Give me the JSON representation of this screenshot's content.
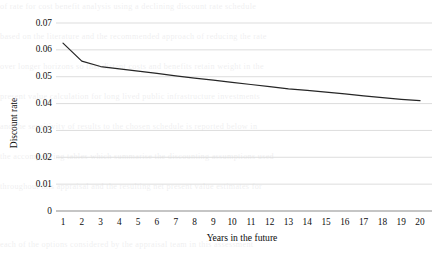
{
  "chart_data": {
    "type": "line",
    "title": "",
    "xlabel": "Years in the future",
    "ylabel": "Discount rate",
    "x": [
      1,
      2,
      3,
      4,
      5,
      6,
      7,
      8,
      9,
      10,
      11,
      12,
      13,
      14,
      15,
      16,
      17,
      18,
      19,
      20
    ],
    "values": [
      0.0625,
      0.0558,
      0.0538,
      0.0529,
      0.0521,
      0.0512,
      0.0503,
      0.0495,
      0.0487,
      0.0479,
      0.0471,
      0.0463,
      0.0455,
      0.0449,
      0.0443,
      0.0436,
      0.0429,
      0.0422,
      0.0416,
      0.0411
    ],
    "series": [
      {
        "name": "Discount rate",
        "values": [
          0.0625,
          0.0558,
          0.0538,
          0.0529,
          0.0521,
          0.0512,
          0.0503,
          0.0495,
          0.0487,
          0.0479,
          0.0471,
          0.0463,
          0.0455,
          0.0449,
          0.0443,
          0.0436,
          0.0429,
          0.0422,
          0.0416,
          0.0411
        ],
        "color": "#262626"
      }
    ],
    "xtick_labels": [
      "1",
      "2",
      "3",
      "4",
      "5",
      "6",
      "7",
      "8",
      "9",
      "10",
      "11",
      "12",
      "13",
      "14",
      "15",
      "16",
      "17",
      "18",
      "19",
      "20"
    ],
    "ytick_labels": [
      "0.07",
      "0.06",
      "0.05",
      "0.04",
      "0.03",
      "0.02",
      "0.01",
      "0"
    ],
    "ytick_values": [
      0.07,
      0.06,
      0.05,
      0.04,
      0.03,
      0.02,
      0.01,
      0
    ],
    "ylim": [
      0,
      0.07
    ],
    "xlim": [
      1,
      20
    ],
    "grid": "horizontal",
    "legend": "none",
    "gridline_color": "#d9d9d9",
    "axis_color": "#8c8c8c",
    "line_color": "#262626",
    "background_color": "#ffffff"
  },
  "background_text": {
    "lines": [
      "of rate for cost benefit analysis using a declining discount rate schedule",
      "based on the literature and the recommended approach of reducing the rate",
      "over longer horizons so that distant costs and benefits retain weight in the",
      "present value calculation for long lived public infrastructure investments",
      "and the sensitivity of results to the chosen schedule is reported below in",
      "the accompanying tables which summarise the discounting assumptions used",
      "throughout this appraisal and the resulting net present value estimates for",
      "each of the options considered by the appraisal team in this assessment"
    ]
  }
}
